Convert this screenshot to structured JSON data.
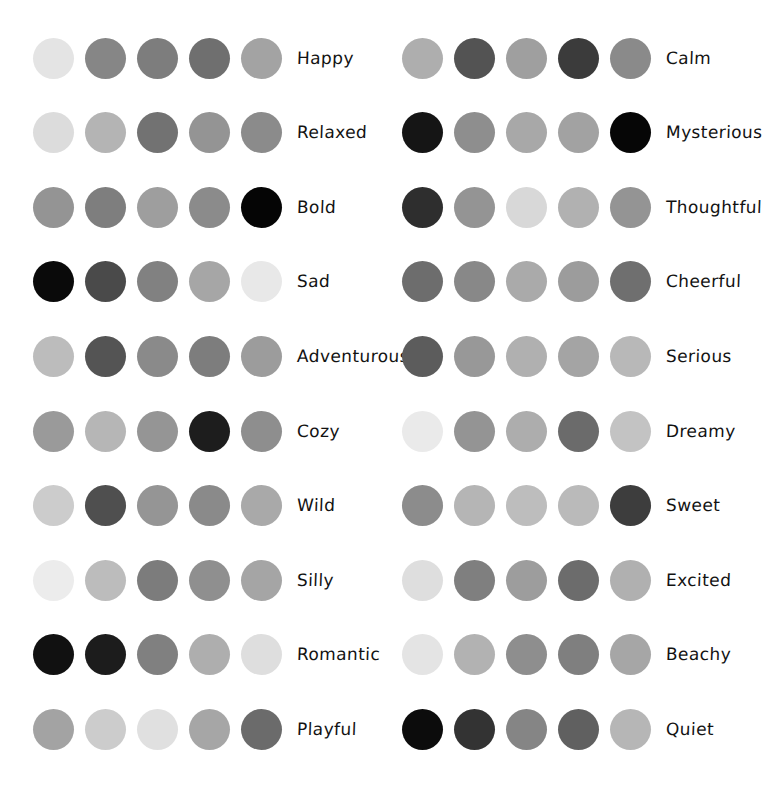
{
  "page": {
    "background": "#ffffff",
    "label_color": "#121212",
    "swatches_per_palette": 5,
    "columns": 2,
    "rows_per_column": 10
  },
  "columns": [
    {
      "name": "left-column",
      "palettes": [
        {
          "label": "Happy",
          "colors": [
            "#e4e4e4",
            "#868686",
            "#7d7d7d",
            "#6f6f6f",
            "#a3a3a3"
          ]
        },
        {
          "label": "Relaxed",
          "colors": [
            "#dcdcdc",
            "#b4b4b4",
            "#727272",
            "#949494",
            "#8b8b8b"
          ]
        },
        {
          "label": "Bold",
          "colors": [
            "#949494",
            "#7e7e7e",
            "#9e9e9e",
            "#8b8b8b",
            "#050505"
          ]
        },
        {
          "label": "Sad",
          "colors": [
            "#0a0a0a",
            "#4a4a4a",
            "#818181",
            "#a6a6a6",
            "#e8e8e8"
          ]
        },
        {
          "label": "Adventurous",
          "colors": [
            "#bcbcbc",
            "#545454",
            "#8a8a8a",
            "#7d7d7d",
            "#9c9c9c"
          ]
        },
        {
          "label": "Cozy",
          "colors": [
            "#9a9a9a",
            "#b6b6b6",
            "#959595",
            "#1d1d1d",
            "#8e8e8e"
          ]
        },
        {
          "label": "Wild",
          "colors": [
            "#cccccc",
            "#4f4f4f",
            "#959595",
            "#8a8a8a",
            "#a9a9a9"
          ]
        },
        {
          "label": "Silly",
          "colors": [
            "#ececec",
            "#bcbcbc",
            "#7c7c7c",
            "#8f8f8f",
            "#a5a5a5"
          ]
        },
        {
          "label": "Romantic",
          "colors": [
            "#111111",
            "#1c1c1c",
            "#808080",
            "#aeaeae",
            "#dedede"
          ]
        },
        {
          "label": "Playful",
          "colors": [
            "#a3a3a3",
            "#cccccc",
            "#e0e0e0",
            "#a6a6a6",
            "#6b6b6b"
          ]
        }
      ]
    },
    {
      "name": "right-column",
      "palettes": [
        {
          "label": "Calm",
          "colors": [
            "#aeaeae",
            "#535353",
            "#9f9f9f",
            "#3b3b3b",
            "#8a8a8a"
          ]
        },
        {
          "label": "Mysterious",
          "colors": [
            "#151515",
            "#8e8e8e",
            "#a8a8a8",
            "#a2a2a2",
            "#060606"
          ]
        },
        {
          "label": "Thoughtful",
          "colors": [
            "#2e2e2e",
            "#949494",
            "#d8d8d8",
            "#b1b1b1",
            "#949494"
          ]
        },
        {
          "label": "Cheerful",
          "colors": [
            "#6d6d6d",
            "#888888",
            "#aaaaaa",
            "#9c9c9c",
            "#6f6f6f"
          ]
        },
        {
          "label": "Serious",
          "colors": [
            "#5c5c5c",
            "#989898",
            "#b0b0b0",
            "#a4a4a4",
            "#b8b8b8"
          ]
        },
        {
          "label": "Dreamy",
          "colors": [
            "#eaeaea",
            "#949494",
            "#adadad",
            "#6b6b6b",
            "#c3c3c3"
          ]
        },
        {
          "label": "Sweet",
          "colors": [
            "#8c8c8c",
            "#b5b5b5",
            "#bdbdbd",
            "#bababa",
            "#3d3d3d"
          ]
        },
        {
          "label": "Excited",
          "colors": [
            "#dedede",
            "#7f7f7f",
            "#9d9d9d",
            "#6c6c6c",
            "#b0b0b0"
          ]
        },
        {
          "label": "Beachy",
          "colors": [
            "#e4e4e4",
            "#b2b2b2",
            "#8e8e8e",
            "#7f7f7f",
            "#a6a6a6"
          ]
        },
        {
          "label": "Quiet",
          "colors": [
            "#0c0c0c",
            "#333333",
            "#858585",
            "#606060",
            "#b6b6b6"
          ]
        }
      ]
    }
  ]
}
